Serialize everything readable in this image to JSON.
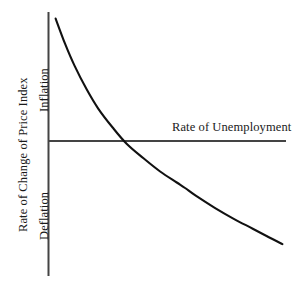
{
  "figure": {
    "background_color": "#ffffff",
    "ink_color": "#1a1a1a",
    "axis_color": "#444444",
    "curve_color": "#111111"
  },
  "labels": {
    "y_axis": "Rate of Change of Price Index",
    "y_upper_region": "Inflation",
    "y_lower_region": "Deflation",
    "x_axis": "Rate of Unemployment"
  },
  "chart_data": {
    "type": "line",
    "title": "",
    "subtitle": "",
    "xlabel": "Rate of Unemployment",
    "ylabel": "Rate of Change of Price Index",
    "grid": false,
    "legend": null,
    "legend_position": "none",
    "annotations": [
      {
        "text": "Inflation",
        "region": "y-axis-upper",
        "rotation": -90
      },
      {
        "text": "Deflation",
        "region": "y-axis-lower",
        "rotation": -90
      },
      {
        "text": "Rate of Unemployment",
        "region": "x-axis-right",
        "rotation": 0
      }
    ],
    "axes": {
      "x_tick_labels": [],
      "y_tick_labels": [],
      "xlim": [
        0,
        10
      ],
      "ylim": [
        -4,
        8
      ],
      "x_zero_at": 0,
      "y_zero_line": 0,
      "y_zero_line_label": "zero rate of change"
    },
    "series": [
      {
        "name": "Phillips Curve",
        "color": "#111111",
        "points": [
          {
            "x": 0.3,
            "y": 7.7
          },
          {
            "x": 0.7,
            "y": 6.55
          },
          {
            "x": 1.1,
            "y": 5.55
          },
          {
            "x": 1.6,
            "y": 4.5
          },
          {
            "x": 2.1,
            "y": 3.6
          },
          {
            "x": 2.7,
            "y": 2.75
          },
          {
            "x": 3.3,
            "y": 2.0
          },
          {
            "x": 4.0,
            "y": 1.35
          },
          {
            "x": 4.7,
            "y": 0.75
          },
          {
            "x": 5.4,
            "y": 0.25
          },
          {
            "x": 5.75,
            "y": 0.0
          },
          {
            "x": 6.2,
            "y": -0.35
          },
          {
            "x": 7.0,
            "y": -0.9
          },
          {
            "x": 7.8,
            "y": -1.4
          },
          {
            "x": 8.6,
            "y": -1.85
          },
          {
            "x": 9.3,
            "y": -2.25
          },
          {
            "x": 9.85,
            "y": -2.55
          }
        ]
      }
    ]
  }
}
